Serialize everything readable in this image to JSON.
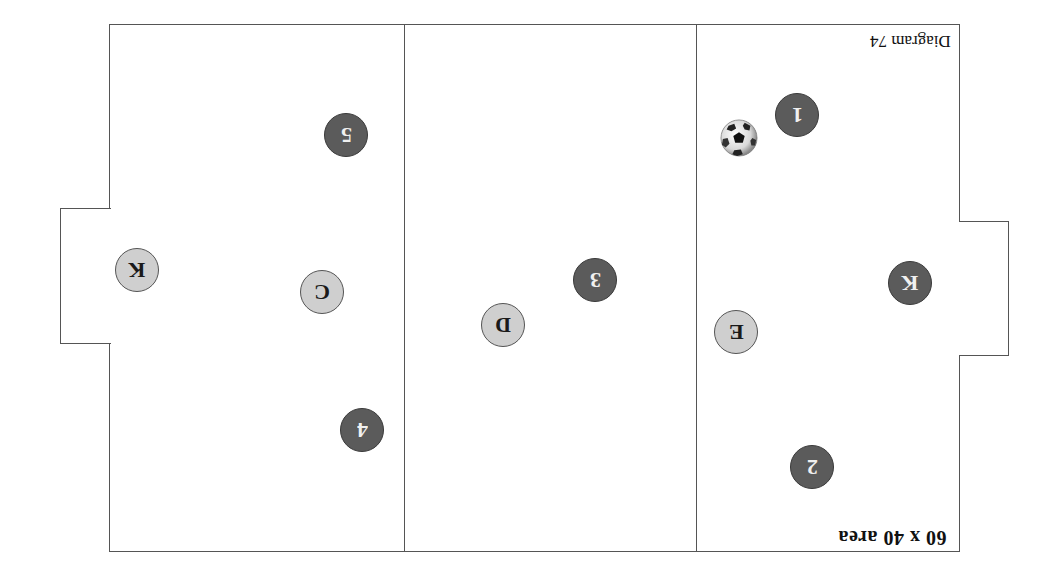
{
  "diagram": {
    "title": "60 x 40 area",
    "diagram_label": "Diagram 74",
    "orientation": "rotated 180 degrees",
    "colors": {
      "line": "#555555",
      "team_dark": "#5b5b5b",
      "team_light": "#cfcfcf",
      "background": "#ffffff"
    },
    "zones": 3,
    "players": [
      {
        "label": "1",
        "team": "dark",
        "x": 797,
        "y": 115
      },
      {
        "label": "2",
        "team": "dark",
        "x": 812,
        "y": 467
      },
      {
        "label": "3",
        "team": "dark",
        "x": 595,
        "y": 280
      },
      {
        "label": "4",
        "team": "dark",
        "x": 362,
        "y": 430
      },
      {
        "label": "5",
        "team": "dark",
        "x": 346,
        "y": 135
      },
      {
        "label": "K",
        "team": "dark",
        "x": 910,
        "y": 283
      },
      {
        "label": "K",
        "team": "light",
        "x": 137,
        "y": 270
      },
      {
        "label": "C",
        "team": "light",
        "x": 322,
        "y": 292
      },
      {
        "label": "D",
        "team": "light",
        "x": 503,
        "y": 325
      },
      {
        "label": "E",
        "team": "light",
        "x": 736,
        "y": 332
      }
    ],
    "ball": {
      "icon": "soccer-ball-icon",
      "x": 739,
      "y": 138
    }
  }
}
